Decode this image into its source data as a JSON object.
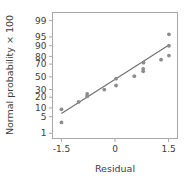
{
  "chart_data": {
    "type": "scatter",
    "title": "",
    "xlabel": "Residual",
    "ylabel": "Normal probability × 100",
    "xlim": [
      -1.75,
      1.75
    ],
    "xticks": [
      -1.5,
      0,
      1.5
    ],
    "xticklabels": [
      "-1.5",
      "0",
      "1.5"
    ],
    "yscale": "probit",
    "ylim": [
      0.55,
      99.6
    ],
    "yticks": [
      1,
      5,
      10,
      20,
      30,
      50,
      70,
      80,
      90,
      95,
      99
    ],
    "yticklabels": [
      "1",
      "5",
      "10",
      "20",
      "30",
      "50",
      "70",
      "80",
      "90",
      "95",
      "99"
    ],
    "grid": false,
    "legend": null,
    "series": [
      {
        "name": "residual-quantiles",
        "marker": "circle",
        "color": "#8c8c8c",
        "x": [
          -1.5,
          -1.5,
          -1.02,
          -0.78,
          -0.78,
          -0.3,
          0.03,
          0.03,
          0.54,
          0.79,
          0.79,
          0.8,
          1.29,
          1.51,
          1.51,
          1.51
        ],
        "y": [
          9.0,
          3.0,
          15.0,
          21.0,
          24.0,
          30.0,
          36.0,
          47.0,
          51.0,
          59.0,
          63.0,
          72.0,
          76.0,
          81.0,
          90.0,
          96.0
        ]
      }
    ],
    "fit_line": {
      "name": "reference-line",
      "color": "#6e6e6e",
      "x": [
        -1.5,
        1.51
      ],
      "y": [
        6.5,
        90.5
      ]
    }
  },
  "axes": {
    "frame_color": "#a8a8a8",
    "tick_color": "#a8a8a8",
    "text_color": "#3c3c3c"
  }
}
